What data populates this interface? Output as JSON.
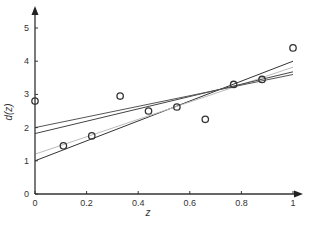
{
  "chart_data": {
    "type": "scatter",
    "title": "",
    "xlabel": "z",
    "ylabel": "d(z)",
    "xlim": [
      0,
      1
    ],
    "ylim": [
      0,
      5.5
    ],
    "grid": false,
    "legend": null,
    "x_ticks": [
      "0",
      "0.2",
      "0.4",
      "0.6",
      "0.8",
      "1"
    ],
    "y_ticks": [
      "0",
      "1",
      "2",
      "3",
      "4",
      "5"
    ],
    "points": {
      "name": "observations",
      "marker": "open-circle",
      "x": [
        0.0,
        0.11,
        0.22,
        0.33,
        0.44,
        0.55,
        0.66,
        0.77,
        0.88,
        1.0
      ],
      "y": [
        2.8,
        1.45,
        1.75,
        2.95,
        2.5,
        2.62,
        2.25,
        3.3,
        3.45,
        4.4
      ]
    },
    "lines": [
      {
        "name": "fit-1",
        "color": "#333333",
        "x": [
          0,
          1
        ],
        "y": [
          1.0,
          4.0
        ]
      },
      {
        "name": "fit-2",
        "color": "#bbbbbb",
        "x": [
          0,
          1
        ],
        "y": [
          1.2,
          3.82
        ]
      },
      {
        "name": "fit-3",
        "color": "#444444",
        "x": [
          0,
          1
        ],
        "y": [
          1.82,
          3.68
        ]
      },
      {
        "name": "fit-4",
        "color": "#555555",
        "x": [
          0,
          1
        ],
        "y": [
          2.0,
          3.6
        ]
      }
    ]
  },
  "colors": {
    "axis": "#333333",
    "marker": "#333333"
  }
}
